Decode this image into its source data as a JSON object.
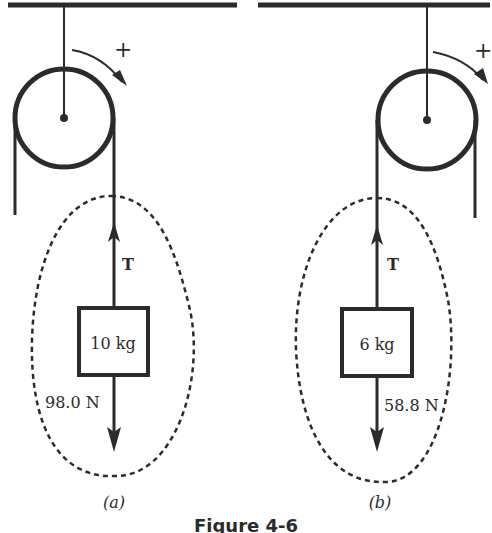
{
  "figure": {
    "caption": "Figure 4-6",
    "panels": [
      {
        "id": "a",
        "label": "(a)",
        "rotation_sign": "+",
        "tension_label": "T",
        "mass_label": "10 kg",
        "weight_label": "98.0 N"
      },
      {
        "id": "b",
        "label": "(b)",
        "rotation_sign": "+",
        "tension_label": "T",
        "mass_label": "6 kg",
        "weight_label": "58.8 N"
      }
    ]
  },
  "colors": {
    "ink": "#2b2b2b",
    "background": "#ffffff"
  }
}
